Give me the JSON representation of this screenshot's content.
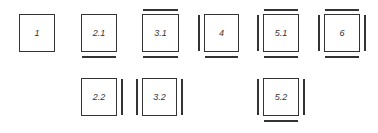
{
  "colors": {
    "stroke": "#333333",
    "background": "#ffffff"
  },
  "boxes": [
    {
      "id": "1",
      "label": "1",
      "x": 19,
      "y": 14,
      "w": 36,
      "h": 38,
      "top": false,
      "bottom": false,
      "left": false,
      "right": false
    },
    {
      "id": "2.1",
      "label": "2.1",
      "x": 81,
      "y": 14,
      "w": 36,
      "h": 38,
      "top": false,
      "bottom": true,
      "left": false,
      "right": false
    },
    {
      "id": "3.1",
      "label": "3.1",
      "x": 142,
      "y": 14,
      "w": 37,
      "h": 38,
      "top": true,
      "bottom": true,
      "left": false,
      "right": false
    },
    {
      "id": "4",
      "label": "4",
      "x": 204,
      "y": 14,
      "w": 35,
      "h": 38,
      "top": false,
      "bottom": true,
      "left": true,
      "right": false
    },
    {
      "id": "5.1",
      "label": "5.1",
      "x": 263,
      "y": 14,
      "w": 36,
      "h": 38,
      "top": true,
      "bottom": true,
      "left": true,
      "right": false
    },
    {
      "id": "6",
      "label": "6",
      "x": 324,
      "y": 14,
      "w": 36,
      "h": 38,
      "top": true,
      "bottom": true,
      "left": true,
      "right": true
    },
    {
      "id": "2.2",
      "label": "2.2",
      "x": 81,
      "y": 78,
      "w": 36,
      "h": 38,
      "top": false,
      "bottom": false,
      "left": false,
      "right": true
    },
    {
      "id": "3.2",
      "label": "3.2",
      "x": 142,
      "y": 78,
      "w": 35,
      "h": 38,
      "top": false,
      "bottom": false,
      "left": true,
      "right": true
    },
    {
      "id": "5.2",
      "label": "5.2",
      "x": 263,
      "y": 78,
      "w": 36,
      "h": 38,
      "top": false,
      "bottom": true,
      "left": true,
      "right": true
    }
  ]
}
